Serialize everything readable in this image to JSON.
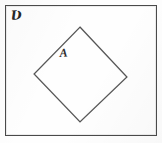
{
  "figure": {
    "kind": "set-diagram",
    "caption_absent": true,
    "background_color": "#fefefe",
    "ink_color": "#3a3a3a"
  },
  "universe": {
    "label": "U̶",
    "label_display": "Ʋ",
    "name": "universal-set",
    "shape": "rectangle",
    "stroke_color": "#4a4a4a",
    "stroke_width": 1,
    "fill": "none",
    "rect": {
      "x": 5,
      "y": 5,
      "width": 152,
      "height": 131
    },
    "label_position": {
      "x": 10,
      "y": 9
    }
  },
  "set_a": {
    "label": "A",
    "name": "set-a",
    "shape": "rotated-square",
    "stroke_color": "#555555",
    "stroke_width": 1,
    "fill": "none",
    "vertices": [
      {
        "x": 80,
        "y": 27
      },
      {
        "x": 127,
        "y": 77
      },
      {
        "x": 80,
        "y": 122
      },
      {
        "x": 34,
        "y": 74
      }
    ],
    "label_position": {
      "x": 59,
      "y": 47
    }
  },
  "canvas": {
    "width": 162,
    "height": 143
  }
}
